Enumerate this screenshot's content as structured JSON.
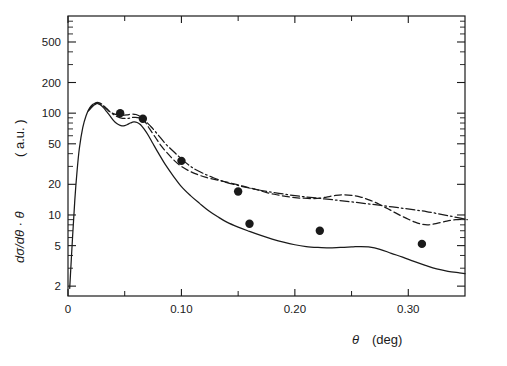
{
  "figure": {
    "background_color": "#ffffff",
    "ink_color": "#1a1a1a",
    "xlabel_symbol": "θ",
    "xlabel_unit": "(deg)",
    "ylabel_symbol": "dσ/dθ · θ",
    "ylabel_unit": "( a.u. )"
  },
  "chart_data": {
    "type": "line",
    "title": "",
    "xlabel": "θ  (deg)",
    "ylabel": "dσ/dθ · θ   ( a.u. )",
    "xscale": "linear",
    "yscale": "log",
    "xlim": [
      0,
      0.35
    ],
    "ylim": [
      1.6,
      900
    ],
    "grid": false,
    "legend": "none",
    "x_major_ticks": [
      0,
      0.1,
      0.2,
      0.3
    ],
    "x_major_tick_labels": [
      "0",
      "0.10",
      "0.20",
      "0.30"
    ],
    "x_minor_ticks": [
      0.05,
      0.15,
      0.25,
      0.35
    ],
    "y_major_ticks": [
      2,
      5,
      10,
      20,
      50,
      100,
      200,
      500
    ],
    "y_major_tick_labels": [
      "2",
      "5",
      "10",
      "20",
      "50",
      "100",
      "200",
      "500"
    ],
    "y_minor_ticks": [
      3,
      4,
      6,
      7,
      8,
      9,
      30,
      40,
      60,
      70,
      80,
      90,
      300,
      400,
      600,
      700,
      800
    ],
    "series": [
      {
        "name": "solid-curve",
        "style": "solid",
        "points": [
          [
            0.0015,
            1.9
          ],
          [
            0.004,
            6
          ],
          [
            0.006,
            14
          ],
          [
            0.008,
            27
          ],
          [
            0.01,
            45
          ],
          [
            0.013,
            72
          ],
          [
            0.016,
            95
          ],
          [
            0.019,
            112
          ],
          [
            0.022,
            122
          ],
          [
            0.025,
            125
          ],
          [
            0.028,
            122
          ],
          [
            0.031,
            114
          ],
          [
            0.034,
            104
          ],
          [
            0.037,
            94
          ],
          [
            0.04,
            85
          ],
          [
            0.043,
            79
          ],
          [
            0.046,
            76
          ],
          [
            0.049,
            75
          ],
          [
            0.052,
            77
          ],
          [
            0.055,
            80
          ],
          [
            0.058,
            82
          ],
          [
            0.061,
            81
          ],
          [
            0.064,
            77
          ],
          [
            0.067,
            70
          ],
          [
            0.071,
            60
          ],
          [
            0.075,
            50
          ],
          [
            0.08,
            40
          ],
          [
            0.086,
            31
          ],
          [
            0.093,
            24
          ],
          [
            0.1,
            19
          ],
          [
            0.108,
            15.5
          ],
          [
            0.116,
            13
          ],
          [
            0.124,
            11
          ],
          [
            0.132,
            9.6
          ],
          [
            0.14,
            8.5
          ],
          [
            0.15,
            7.6
          ],
          [
            0.16,
            6.9
          ],
          [
            0.17,
            6.3
          ],
          [
            0.18,
            5.8
          ],
          [
            0.19,
            5.4
          ],
          [
            0.2,
            5.1
          ],
          [
            0.21,
            4.9
          ],
          [
            0.22,
            4.8
          ],
          [
            0.23,
            4.75
          ],
          [
            0.24,
            4.8
          ],
          [
            0.25,
            4.85
          ],
          [
            0.258,
            4.9
          ],
          [
            0.265,
            4.85
          ],
          [
            0.275,
            4.6
          ],
          [
            0.285,
            4.2
          ],
          [
            0.295,
            3.85
          ],
          [
            0.305,
            3.5
          ],
          [
            0.315,
            3.2
          ],
          [
            0.325,
            2.95
          ],
          [
            0.335,
            2.8
          ],
          [
            0.345,
            2.7
          ],
          [
            0.35,
            2.65
          ]
        ]
      },
      {
        "name": "dashed-curve",
        "style": "dashed",
        "points": [
          [
            0.018,
            105
          ],
          [
            0.021,
            118
          ],
          [
            0.024,
            126
          ],
          [
            0.027,
            127
          ],
          [
            0.03,
            122
          ],
          [
            0.033,
            113
          ],
          [
            0.036,
            105
          ],
          [
            0.04,
            99
          ],
          [
            0.044,
            96
          ],
          [
            0.048,
            95
          ],
          [
            0.052,
            96
          ],
          [
            0.056,
            98
          ],
          [
            0.06,
            97
          ],
          [
            0.064,
            92
          ],
          [
            0.068,
            82
          ],
          [
            0.072,
            70
          ],
          [
            0.077,
            58
          ],
          [
            0.082,
            48
          ],
          [
            0.088,
            40
          ],
          [
            0.094,
            34
          ],
          [
            0.1,
            30
          ],
          [
            0.107,
            27
          ],
          [
            0.114,
            25
          ],
          [
            0.121,
            23.5
          ],
          [
            0.128,
            22.5
          ],
          [
            0.136,
            21.5
          ],
          [
            0.144,
            20.5
          ],
          [
            0.152,
            19.5
          ],
          [
            0.16,
            18.5
          ],
          [
            0.168,
            17.5
          ],
          [
            0.176,
            16.5
          ],
          [
            0.184,
            15.8
          ],
          [
            0.192,
            15.2
          ],
          [
            0.2,
            14.8
          ],
          [
            0.208,
            14.6
          ],
          [
            0.216,
            14.5
          ],
          [
            0.222,
            14.6
          ],
          [
            0.228,
            15.0
          ],
          [
            0.235,
            15.5
          ],
          [
            0.242,
            15.8
          ],
          [
            0.25,
            15.6
          ],
          [
            0.258,
            15.0
          ],
          [
            0.266,
            14.0
          ],
          [
            0.274,
            12.8
          ],
          [
            0.282,
            11.5
          ],
          [
            0.29,
            10.3
          ],
          [
            0.298,
            9.3
          ],
          [
            0.306,
            8.5
          ],
          [
            0.312,
            8.1
          ],
          [
            0.318,
            8.0
          ],
          [
            0.326,
            8.3
          ],
          [
            0.334,
            8.7
          ],
          [
            0.342,
            9.0
          ],
          [
            0.35,
            9.1
          ]
        ]
      },
      {
        "name": "dash-dot-curve",
        "style": "dashdot",
        "points": [
          [
            0.019,
            108
          ],
          [
            0.023,
            120
          ],
          [
            0.026,
            124
          ],
          [
            0.03,
            120
          ],
          [
            0.034,
            111
          ],
          [
            0.038,
            101
          ],
          [
            0.043,
            93
          ],
          [
            0.048,
            89
          ],
          [
            0.053,
            89
          ],
          [
            0.058,
            91
          ],
          [
            0.063,
            90
          ],
          [
            0.068,
            84
          ],
          [
            0.073,
            74
          ],
          [
            0.079,
            62
          ],
          [
            0.086,
            50
          ],
          [
            0.094,
            41
          ],
          [
            0.102,
            34
          ],
          [
            0.11,
            29
          ],
          [
            0.118,
            26
          ],
          [
            0.127,
            23.5
          ],
          [
            0.136,
            21.5
          ],
          [
            0.146,
            20
          ],
          [
            0.156,
            18.8
          ],
          [
            0.166,
            17.8
          ],
          [
            0.176,
            17.0
          ],
          [
            0.186,
            16.3
          ],
          [
            0.196,
            15.7
          ],
          [
            0.206,
            15.2
          ],
          [
            0.216,
            14.8
          ],
          [
            0.226,
            14.4
          ],
          [
            0.236,
            14.0
          ],
          [
            0.246,
            13.6
          ],
          [
            0.256,
            13.2
          ],
          [
            0.266,
            12.8
          ],
          [
            0.276,
            12.4
          ],
          [
            0.286,
            12.0
          ],
          [
            0.296,
            11.6
          ],
          [
            0.306,
            11.2
          ],
          [
            0.316,
            10.8
          ],
          [
            0.326,
            10.3
          ],
          [
            0.336,
            9.8
          ],
          [
            0.346,
            9.3
          ],
          [
            0.352,
            9.0
          ]
        ]
      }
    ],
    "data_points": {
      "name": "experimental-points",
      "marker": "filled-circle",
      "values": [
        [
          0.046,
          100
        ],
        [
          0.066,
          88
        ],
        [
          0.1,
          34
        ],
        [
          0.15,
          17
        ],
        [
          0.16,
          8.2
        ],
        [
          0.222,
          7.0
        ],
        [
          0.312,
          5.2
        ]
      ]
    }
  }
}
